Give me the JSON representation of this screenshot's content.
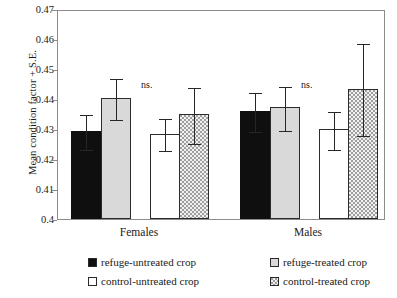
{
  "chart_data": {
    "type": "bar",
    "title": "",
    "xlabel": "",
    "ylabel": "Mean condition factor + S.E.",
    "ylim": [
      0.4,
      0.47
    ],
    "ytick_step": 0.01,
    "ytick_labels": [
      "0.47",
      "0.46",
      "0.45",
      "0.44",
      "0.43",
      "0.42",
      "0.41",
      "0.4"
    ],
    "ytick_values": [
      0.47,
      0.46,
      0.45,
      0.44,
      0.43,
      0.42,
      0.41,
      0.4
    ],
    "categories": [
      "Females",
      "Males"
    ],
    "grid": false,
    "legend_position": "bottom",
    "annotations": [
      {
        "text": "ns.",
        "group": "Females"
      },
      {
        "text": "ns.",
        "group": "Males"
      }
    ],
    "series": [
      {
        "name": "refuge-untreated crop",
        "fill": "black",
        "color": "#100f0f",
        "values": [
          0.4295,
          0.436
        ],
        "errors": [
          0.006,
          0.0067
        ]
      },
      {
        "name": "refuge-treated crop",
        "fill": "light-gray",
        "color": "#d9d9d9",
        "values": [
          0.4405,
          0.4373
        ],
        "errors": [
          0.007,
          0.0075
        ]
      },
      {
        "name": "control-untreated crop",
        "fill": "white",
        "color": "#ffffff",
        "values": [
          0.4285,
          0.43
        ],
        "errors": [
          0.0055,
          0.0065
        ]
      },
      {
        "name": "control-treated crop",
        "fill": "gray-hatched",
        "color": "#9e9e9e",
        "values": [
          0.435,
          0.4435
        ],
        "errors": [
          0.0095,
          0.0155
        ]
      }
    ]
  },
  "axes": {
    "y_title": "Mean condition factor + S.E.",
    "y_ticks": [
      {
        "label": "0.47",
        "value": 0.47
      },
      {
        "label": "0.46",
        "value": 0.46
      },
      {
        "label": "0.45",
        "value": 0.45
      },
      {
        "label": "0.44",
        "value": 0.44
      },
      {
        "label": "0.43",
        "value": 0.43
      },
      {
        "label": "0.42",
        "value": 0.42
      },
      {
        "label": "0.41",
        "value": 0.41
      },
      {
        "label": "0.4",
        "value": 0.4
      }
    ],
    "x_groups": [
      {
        "label": "Females"
      },
      {
        "label": "Males"
      }
    ]
  },
  "annotations": [
    {
      "text": "ns."
    },
    {
      "text": "ns."
    }
  ],
  "legend": {
    "items": [
      {
        "label": "refuge-untreated crop",
        "swatch": "black"
      },
      {
        "label": "refuge-treated crop",
        "swatch": "light-gray"
      },
      {
        "label": "control-untreated crop",
        "swatch": "white"
      },
      {
        "label": "control-treated crop",
        "swatch": "gray-hatched"
      }
    ]
  }
}
